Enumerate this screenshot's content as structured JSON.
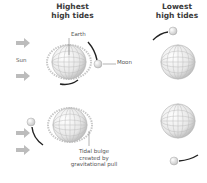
{
  "titles": {
    "highest": "Highest high tides",
    "highest_line1": "Highest",
    "highest_line2": "high tides",
    "lowest_line1": "Lowest",
    "lowest_line2": "high tides"
  },
  "labels": {
    "sun": "Sun",
    "earth": "Earth",
    "moon": "Moon",
    "bulge_line1": "Tidal bulge",
    "bulge_line2": "created by",
    "bulge_line3": "gravitational pull"
  },
  "colors": {
    "globe_fill": "#f2f2f2",
    "globe_grid": "#bdbdbd",
    "bulge": "#c8c8c8",
    "arrow": "#bcbcbc",
    "orbit": "#222222",
    "text": "#3a3a3a"
  }
}
